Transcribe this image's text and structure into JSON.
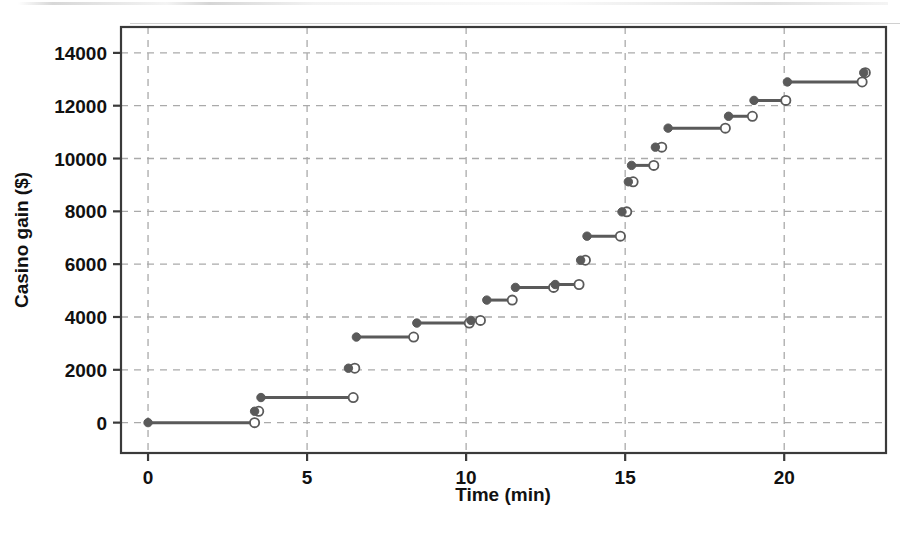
{
  "figure": {
    "background_color": "#ffffff",
    "frame_color": "#3a3a3a",
    "grid_color": "#aaaaaa",
    "series_color": "#5a5a5a"
  },
  "chart_data": {
    "type": "line",
    "subtype": "step-function",
    "title": "",
    "xlabel": "Time (min)",
    "ylabel": "Casino gain ($)",
    "xlim": [
      -0.85,
      23.2
    ],
    "ylim": [
      -1150,
      14980
    ],
    "xticks": [
      0,
      5,
      10,
      15,
      20
    ],
    "xtick_labels": [
      "0",
      "5",
      "10",
      "15",
      "20"
    ],
    "yticks": [
      0,
      2000,
      4000,
      6000,
      8000,
      10000,
      12000,
      14000
    ],
    "ytick_labels": [
      "0",
      "2000",
      "4000",
      "6000",
      "8000",
      "10000",
      "12000",
      "14000"
    ],
    "grid": true,
    "grid_style": "dashed",
    "legend": null,
    "marker_start": "filled-circle",
    "marker_end": "open-circle",
    "steps": [
      {
        "x_start": 0.0,
        "x_end": 3.35,
        "y": 0
      },
      {
        "x_start": 3.35,
        "x_end": 3.48,
        "y": 430
      },
      {
        "x_start": 3.55,
        "x_end": 6.45,
        "y": 950
      },
      {
        "x_start": 6.3,
        "x_end": 6.5,
        "y": 2060
      },
      {
        "x_start": 6.55,
        "x_end": 8.35,
        "y": 3240
      },
      {
        "x_start": 8.45,
        "x_end": 10.1,
        "y": 3770
      },
      {
        "x_start": 10.15,
        "x_end": 10.45,
        "y": 3870
      },
      {
        "x_start": 10.65,
        "x_end": 11.45,
        "y": 4640
      },
      {
        "x_start": 11.55,
        "x_end": 12.75,
        "y": 5120
      },
      {
        "x_start": 12.8,
        "x_end": 13.55,
        "y": 5230
      },
      {
        "x_start": 13.6,
        "x_end": 13.75,
        "y": 6150
      },
      {
        "x_start": 13.8,
        "x_end": 14.85,
        "y": 7060
      },
      {
        "x_start": 14.9,
        "x_end": 15.05,
        "y": 7980
      },
      {
        "x_start": 15.1,
        "x_end": 15.25,
        "y": 9120
      },
      {
        "x_start": 15.2,
        "x_end": 15.9,
        "y": 9740
      },
      {
        "x_start": 15.95,
        "x_end": 16.15,
        "y": 10430
      },
      {
        "x_start": 16.35,
        "x_end": 18.15,
        "y": 11150
      },
      {
        "x_start": 18.25,
        "x_end": 19.0,
        "y": 11600
      },
      {
        "x_start": 19.05,
        "x_end": 20.05,
        "y": 12200
      },
      {
        "x_start": 20.1,
        "x_end": 22.45,
        "y": 12900
      },
      {
        "x_start": 22.5,
        "x_end": 22.55,
        "y": 13250
      }
    ]
  }
}
